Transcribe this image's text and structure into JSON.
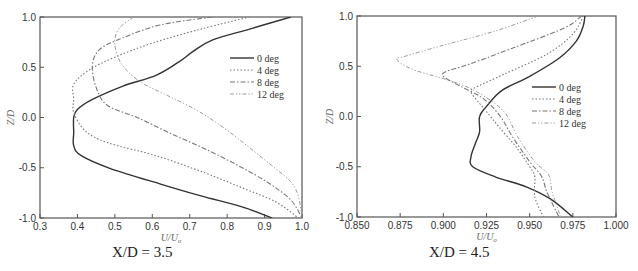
{
  "chart_data": [
    {
      "type": "line",
      "title": "",
      "caption": "X/D = 3.5",
      "xlabel": "U/U0",
      "ylabel": "Z/D",
      "xlim": [
        0.3,
        1.0
      ],
      "ylim": [
        -1.0,
        1.0
      ],
      "xticks": [
        "0.3",
        "0.4",
        "0.5",
        "0.6",
        "0.7",
        "0.8",
        "0.9",
        "1.0"
      ],
      "yticks": [
        "-1.0",
        "-0.5",
        "0.0",
        "0.5",
        "1.0"
      ],
      "grid": false,
      "legend_position": "upper right",
      "series": [
        {
          "name": "0 deg",
          "style": "solid",
          "points": [
            [
              0.97,
              1.0
            ],
            [
              0.86,
              0.88
            ],
            [
              0.76,
              0.77
            ],
            [
              0.71,
              0.66
            ],
            [
              0.67,
              0.55
            ],
            [
              0.61,
              0.42
            ],
            [
              0.52,
              0.31
            ],
            [
              0.44,
              0.18
            ],
            [
              0.4,
              0.08
            ],
            [
              0.39,
              0.0
            ],
            [
              0.39,
              -0.15
            ],
            [
              0.39,
              -0.28
            ],
            [
              0.41,
              -0.38
            ],
            [
              0.49,
              -0.51
            ],
            [
              0.62,
              -0.66
            ],
            [
              0.73,
              -0.78
            ],
            [
              0.84,
              -0.89
            ],
            [
              0.92,
              -1.0
            ]
          ]
        },
        {
          "name": "4 deg",
          "style": "dotted",
          "points": [
            [
              0.86,
              1.0
            ],
            [
              0.73,
              0.88
            ],
            [
              0.6,
              0.74
            ],
            [
              0.5,
              0.6
            ],
            [
              0.43,
              0.47
            ],
            [
              0.39,
              0.33
            ],
            [
              0.39,
              0.18
            ],
            [
              0.39,
              0.05
            ],
            [
              0.42,
              -0.13
            ],
            [
              0.48,
              -0.25
            ],
            [
              0.61,
              -0.38
            ],
            [
              0.74,
              -0.55
            ],
            [
              0.84,
              -0.7
            ],
            [
              0.93,
              -0.84
            ],
            [
              0.99,
              -1.0
            ]
          ]
        },
        {
          "name": "8 deg",
          "style": "dashdot",
          "points": [
            [
              0.76,
              1.0
            ],
            [
              0.62,
              0.92
            ],
            [
              0.52,
              0.79
            ],
            [
              0.46,
              0.68
            ],
            [
              0.44,
              0.52
            ],
            [
              0.45,
              0.3
            ],
            [
              0.48,
              0.12
            ],
            [
              0.56,
              0.0
            ],
            [
              0.65,
              -0.16
            ],
            [
              0.74,
              -0.31
            ],
            [
              0.83,
              -0.48
            ],
            [
              0.91,
              -0.65
            ],
            [
              0.97,
              -0.82
            ],
            [
              1.0,
              -1.0
            ]
          ]
        },
        {
          "name": "12 deg",
          "style": "dashdotdot",
          "points": [
            [
              0.55,
              1.0
            ],
            [
              0.51,
              0.88
            ],
            [
              0.5,
              0.72
            ],
            [
              0.52,
              0.52
            ],
            [
              0.57,
              0.35
            ],
            [
              0.64,
              0.22
            ],
            [
              0.72,
              0.07
            ],
            [
              0.79,
              -0.1
            ],
            [
              0.86,
              -0.3
            ],
            [
              0.93,
              -0.51
            ],
            [
              0.97,
              -0.64
            ],
            [
              0.99,
              -0.78
            ],
            [
              1.0,
              -1.0
            ]
          ]
        }
      ]
    },
    {
      "type": "line",
      "title": "",
      "caption": "X/D = 4.5",
      "xlabel": "U/U0",
      "ylabel": "Z/D",
      "xlim": [
        0.85,
        1.0
      ],
      "ylim": [
        -1.0,
        1.0
      ],
      "xticks": [
        "0.850",
        "0.875",
        "0.900",
        "0.925",
        "0.950",
        "0.975",
        "1.000"
      ],
      "yticks": [
        "-1.0",
        "-0.5",
        "0.0",
        "0.5",
        "1.0"
      ],
      "grid": false,
      "legend_position": "center right",
      "series": [
        {
          "name": "0 deg",
          "style": "solid",
          "points": [
            [
              0.982,
              1.0
            ],
            [
              0.981,
              0.9
            ],
            [
              0.977,
              0.75
            ],
            [
              0.967,
              0.58
            ],
            [
              0.95,
              0.4
            ],
            [
              0.934,
              0.26
            ],
            [
              0.925,
              0.1
            ],
            [
              0.921,
              0.0
            ],
            [
              0.921,
              -0.15
            ],
            [
              0.919,
              -0.25
            ],
            [
              0.916,
              -0.4
            ],
            [
              0.917,
              -0.5
            ],
            [
              0.93,
              -0.6
            ],
            [
              0.948,
              -0.7
            ],
            [
              0.962,
              -0.82
            ],
            [
              0.975,
              -1.0
            ]
          ]
        },
        {
          "name": "4 deg",
          "style": "dotted",
          "points": [
            [
              0.981,
              1.0
            ],
            [
              0.975,
              0.82
            ],
            [
              0.96,
              0.62
            ],
            [
              0.935,
              0.42
            ],
            [
              0.92,
              0.3
            ],
            [
              0.916,
              0.25
            ],
            [
              0.92,
              0.15
            ],
            [
              0.925,
              0.05
            ],
            [
              0.932,
              -0.1
            ],
            [
              0.942,
              -0.3
            ],
            [
              0.95,
              -0.5
            ],
            [
              0.953,
              -0.6
            ],
            [
              0.953,
              -0.8
            ],
            [
              0.958,
              -1.0
            ]
          ]
        },
        {
          "name": "8 deg",
          "style": "dashdot",
          "points": [
            [
              0.98,
              1.0
            ],
            [
              0.97,
              0.88
            ],
            [
              0.94,
              0.68
            ],
            [
              0.915,
              0.52
            ],
            [
              0.902,
              0.45
            ],
            [
              0.9,
              0.4
            ],
            [
              0.91,
              0.3
            ],
            [
              0.923,
              0.18
            ],
            [
              0.933,
              0.0
            ],
            [
              0.94,
              -0.2
            ],
            [
              0.95,
              -0.45
            ],
            [
              0.957,
              -0.6
            ],
            [
              0.96,
              -0.75
            ],
            [
              0.967,
              -1.0
            ]
          ]
        },
        {
          "name": "12 deg",
          "style": "dashdotdot",
          "points": [
            [
              0.955,
              1.0
            ],
            [
              0.93,
              0.85
            ],
            [
              0.898,
              0.7
            ],
            [
              0.878,
              0.6
            ],
            [
              0.873,
              0.57
            ],
            [
              0.882,
              0.47
            ],
            [
              0.905,
              0.35
            ],
            [
              0.92,
              0.24
            ],
            [
              0.935,
              0.05
            ],
            [
              0.943,
              -0.2
            ],
            [
              0.953,
              -0.45
            ],
            [
              0.961,
              -0.58
            ],
            [
              0.963,
              -0.75
            ],
            [
              0.968,
              -1.0
            ]
          ]
        }
      ]
    }
  ],
  "panels": [
    {
      "caption": "X/D = 3.5",
      "xlabel": "U/U",
      "xlabel_sub": "o",
      "ylabel": "Z/D"
    },
    {
      "caption": "X/D = 4.5",
      "xlabel": "U/U",
      "xlabel_sub": "o",
      "ylabel": "Z/D"
    }
  ],
  "colors": {
    "0 deg": "#333333",
    "4 deg": "#777777",
    "8 deg": "#777777",
    "12 deg": "#9a9a9a",
    "frame": "#555555"
  }
}
